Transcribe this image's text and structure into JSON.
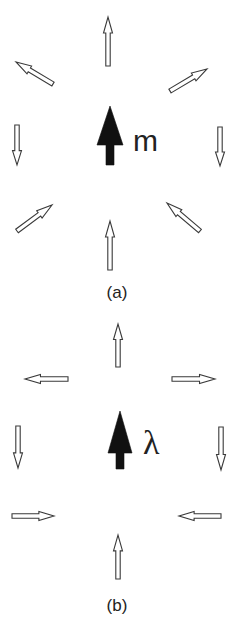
{
  "panels": [
    {
      "id": "a",
      "caption": "(a)",
      "caption_pos": [
        117,
        298
      ],
      "center_symbol": "m",
      "center_symbol_pos": [
        146,
        151
      ],
      "center_arrow": {
        "x": 110,
        "tip": 106,
        "head_base": 145,
        "tail": 165,
        "head_half_width": 13,
        "shaft_half_width": 4
      },
      "arrows": [
        {
          "name": "top-arrow-up",
          "from": [
            108,
            66
          ],
          "to": [
            108,
            17
          ]
        },
        {
          "name": "upper-left-arrow",
          "from": [
            53,
            84
          ],
          "to": [
            16,
            62
          ]
        },
        {
          "name": "upper-right-arrow",
          "from": [
            170,
            91
          ],
          "to": [
            207,
            69
          ]
        },
        {
          "name": "left-arrow-down",
          "from": [
            17,
            125
          ],
          "to": [
            17,
            165
          ]
        },
        {
          "name": "right-arrow-down",
          "from": [
            220,
            127
          ],
          "to": [
            220,
            166
          ]
        },
        {
          "name": "lower-left-arrow",
          "from": [
            17,
            231
          ],
          "to": [
            52,
            205
          ]
        },
        {
          "name": "lower-right-arrow",
          "from": [
            200,
            231
          ],
          "to": [
            167,
            203
          ]
        },
        {
          "name": "bottom-arrow-up",
          "from": [
            110,
            270
          ],
          "to": [
            110,
            221
          ]
        }
      ]
    },
    {
      "id": "b",
      "caption": "(b)",
      "caption_pos": [
        117,
        611
      ],
      "center_symbol": "λ",
      "center_symbol_pos": [
        153,
        454
      ],
      "center_arrow": {
        "x": 120,
        "tip": 411,
        "head_base": 453,
        "tail": 469,
        "head_half_width": 12,
        "shaft_half_width": 4
      },
      "arrows": [
        {
          "name": "top-arrow-up",
          "from": [
            118,
            367
          ],
          "to": [
            118,
            324
          ]
        },
        {
          "name": "left-arrow-left",
          "from": [
            68,
            379
          ],
          "to": [
            25,
            379
          ]
        },
        {
          "name": "right-arrow-right",
          "from": [
            172,
            379
          ],
          "to": [
            215,
            379
          ]
        },
        {
          "name": "left-arrow-down",
          "from": [
            18,
            426
          ],
          "to": [
            18,
            468
          ]
        },
        {
          "name": "right-arrow-down",
          "from": [
            221,
            427
          ],
          "to": [
            221,
            470
          ]
        },
        {
          "name": "lower-left-arrow-right",
          "from": [
            12,
            516
          ],
          "to": [
            54,
            516
          ]
        },
        {
          "name": "lower-right-arrow-left",
          "from": [
            221,
            516
          ],
          "to": [
            179,
            516
          ]
        },
        {
          "name": "bottom-arrow-up",
          "from": [
            118,
            579
          ],
          "to": [
            118,
            535
          ]
        }
      ]
    }
  ],
  "style": {
    "outline_stroke": "#3a3a3a",
    "filled_color": "#111111",
    "background": "#ffffff"
  }
}
